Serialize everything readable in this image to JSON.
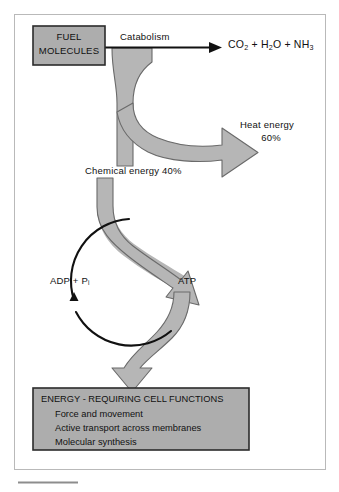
{
  "figure": {
    "frame": {
      "border_color": "#b9b9b9",
      "background": "#ffffff"
    },
    "colors": {
      "fill_gray": "#b6b6b6",
      "box_gray": "#adadad",
      "outline": "#3a3a3a",
      "black": "#111111"
    }
  },
  "nodes": {
    "fuel_box": {
      "line1": "FUEL",
      "line2": "MOLECULES"
    },
    "catabolism_label": "Catabolism",
    "products": {
      "co2": "CO",
      "co2_sub": "2",
      "plus1": "+",
      "h2o": "H",
      "h2o_sub": "2",
      "h2o_tail": "O",
      "plus2": "+",
      "nh3": "NH",
      "nh3_sub": "3"
    },
    "heat": {
      "line1": "Heat energy",
      "line2": "60%"
    },
    "chemical_energy": "Chemical energy  40%",
    "adp": {
      "text": "ADP  +  P",
      "sub": "i"
    },
    "atp": "ATP",
    "functions_box": {
      "heading": "ENERGY - REQUIRING CELL FUNCTIONS",
      "items": [
        "Force and movement",
        "Active transport across membranes",
        "Molecular synthesis"
      ]
    }
  }
}
